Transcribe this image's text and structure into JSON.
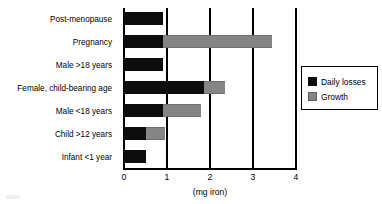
{
  "chart_data": {
    "type": "bar",
    "orientation": "horizontal",
    "stacked": true,
    "title": "",
    "xlabel": "(mg iron)",
    "ylabel": "",
    "xlim": [
      0,
      4
    ],
    "xticks": [
      "0",
      "1",
      "2",
      "3",
      "4"
    ],
    "grid": "vertical",
    "legend_position": "right",
    "categories": [
      "Post-menopause",
      "Pregnancy",
      "Male >18 years",
      "Female, child-bearing age",
      "Male <18 years",
      "Child >12 years",
      "Infant <1 year"
    ],
    "series": [
      {
        "name": "Daily losses",
        "color": "#0d0d0d",
        "values": [
          0.9,
          0.9,
          0.9,
          1.85,
          0.9,
          0.5,
          0.5
        ]
      },
      {
        "name": "Growth",
        "color": "#858585",
        "values": [
          0,
          2.55,
          0,
          0.5,
          0.88,
          0.45,
          0
        ]
      }
    ],
    "totals": [
      0.9,
      3.45,
      0.9,
      2.35,
      1.78,
      0.95,
      0.5
    ]
  },
  "legend": {
    "items": [
      {
        "label": "Daily losses",
        "swatch": "daily-losses-swatch"
      },
      {
        "label": "Growth",
        "swatch": "growth-swatch"
      }
    ]
  }
}
